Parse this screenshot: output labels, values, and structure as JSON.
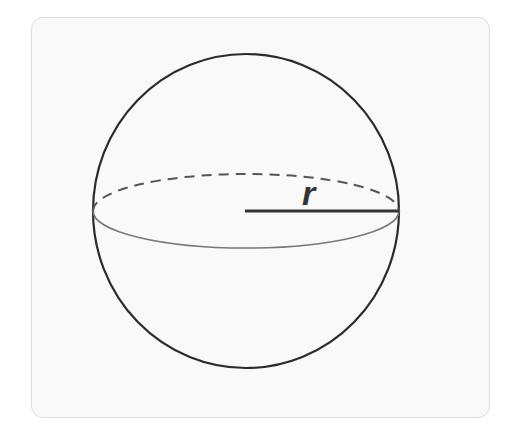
{
  "diagram": {
    "type": "sphere-radius",
    "label_radius": "r",
    "colors": {
      "outline": "#2b2b2b",
      "equator_back_dashed": "#555555",
      "equator_front": "#777777",
      "card_background": "#f9f9f9",
      "card_border": "#dcdcdc"
    },
    "geometry": {
      "center": [
        246,
        211
      ],
      "radius_x": 153,
      "radius_y": 157,
      "equator_ry": 37
    }
  }
}
